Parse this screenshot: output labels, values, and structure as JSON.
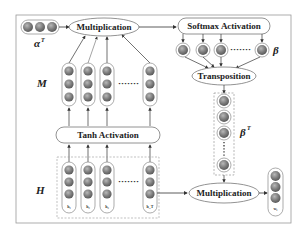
{
  "diagram": {
    "nodes": {
      "alpha_t": {
        "symbol": "α",
        "sup": "T"
      },
      "multiplication_top": {
        "label": "Multiplication"
      },
      "softmax": {
        "label": "Softmax Activation"
      },
      "beta": {
        "symbol": "β"
      },
      "transposition": {
        "label": "Transposition"
      },
      "m_matrix": {
        "symbol": "M"
      },
      "tanh": {
        "label": "Tanh Activation"
      },
      "beta_t": {
        "symbol": "β",
        "sup": "T"
      },
      "h_matrix": {
        "symbol": "H",
        "columns": [
          "h₁",
          "h₂",
          "h₃",
          "h_T"
        ]
      },
      "multiplication_bottom": {
        "label": "Multiplication"
      },
      "output": {
        "sub": "w₁"
      }
    },
    "ellipsis": "·······",
    "colors": {
      "node_fill": "#7a7a7a",
      "node_highlight": "#b5b5b5",
      "border": "#555555",
      "arrow": "#333333",
      "dashed_border": "#888888"
    }
  }
}
